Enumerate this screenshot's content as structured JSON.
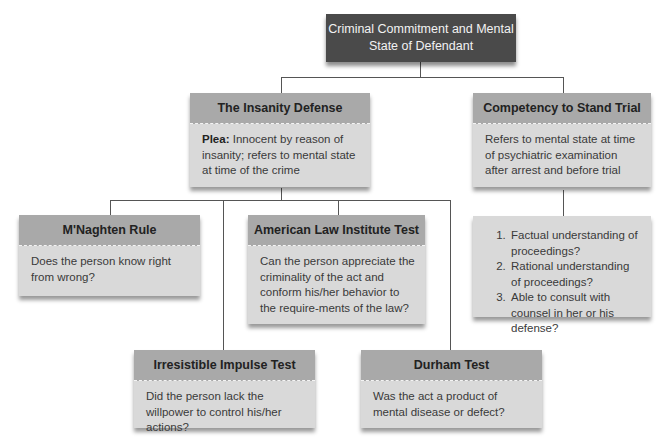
{
  "root": {
    "title": "Criminal Commitment and Mental State of Defendant"
  },
  "insanity_defense": {
    "title": "The Insanity Defense",
    "plea_label": "Plea:",
    "plea_text": " Innocent by reason of insanity; refers to mental state at time of the crime"
  },
  "competency": {
    "title": "Competency to Stand Trial",
    "description": "Refers to mental state at time of psychiatric examination after arrest and before trial",
    "criteria": [
      "Factual understanding of proceedings?",
      "Rational understanding of proceedings?",
      "Able to consult with counsel in her or his defense?"
    ]
  },
  "tests": {
    "mnaghten": {
      "title": "M'Naghten Rule",
      "question": "Does the person know right from wrong?"
    },
    "ali": {
      "title": "American Law Institute Test",
      "question": "Can the person appreciate the criminality of the act and conform his/her behavior to the require-ments of the law?"
    },
    "irresistible": {
      "title": "Irresistible Impulse Test",
      "question": "Did the person lack the willpower to control his/her actions?"
    },
    "durham": {
      "title": "Durham Test",
      "question": "Was the act a product of mental disease or defect?"
    }
  }
}
